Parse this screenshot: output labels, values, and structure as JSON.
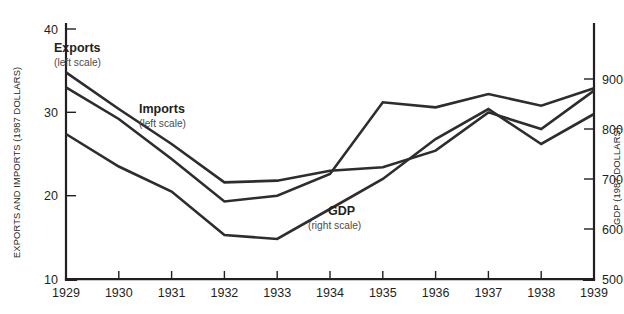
{
  "chart_data": {
    "type": "line",
    "title": "",
    "xlabel": "",
    "ylabel": "EXPORTS AND IMPORTS (1987 DOLLARS)",
    "y2label": "GDP (1987 DOLLARS)",
    "grid": false,
    "legend_position": "inline-annotations",
    "x": [
      1929,
      1930,
      1931,
      1932,
      1933,
      1934,
      1935,
      1936,
      1937,
      1938,
      1939
    ],
    "xlim": [
      1929,
      1939
    ],
    "ylim": [
      10,
      40
    ],
    "y2lim": [
      500,
      900
    ],
    "x_ticks": [
      "1929",
      "1930",
      "1931",
      "1932",
      "1933",
      "1934",
      "1935",
      "1936",
      "1937",
      "1938",
      "1939"
    ],
    "y_ticks": [
      "10",
      "20",
      "30",
      "40"
    ],
    "y_tick_values": [
      10,
      20,
      30,
      40
    ],
    "y2_ticks": [
      "500",
      "600",
      "700",
      "800",
      "900"
    ],
    "y2_tick_values": [
      500,
      600,
      700,
      800,
      900
    ],
    "series": [
      {
        "name": "Exports",
        "axis": "left",
        "scale_note": "(left scale)",
        "values": [
          34.8,
          30.4,
          26.2,
          21.6,
          21.8,
          23.0,
          23.4,
          25.4,
          30.0,
          28.0,
          32.6
        ]
      },
      {
        "name": "Imports",
        "axis": "left",
        "scale_note": "(left scale)",
        "values": [
          33.0,
          29.2,
          24.4,
          19.3,
          20.0,
          22.6,
          31.2,
          30.6,
          32.2,
          30.8,
          32.9
        ]
      },
      {
        "name": "GDP",
        "axis": "right",
        "scale_note": "(right scale)",
        "values": [
          790,
          725,
          675,
          588,
          580,
          640,
          700,
          780,
          840,
          770,
          830
        ]
      }
    ],
    "annotations": [
      {
        "label": "Exports",
        "sublabel": "(left scale)",
        "x_px": 54,
        "y_px": 52
      },
      {
        "label": "Imports",
        "sublabel": "(left scale)",
        "x_px": 139,
        "y_px": 113
      },
      {
        "label": "GDP",
        "sublabel": "(right scale)",
        "x_px": 328,
        "y_px": 215
      }
    ]
  }
}
